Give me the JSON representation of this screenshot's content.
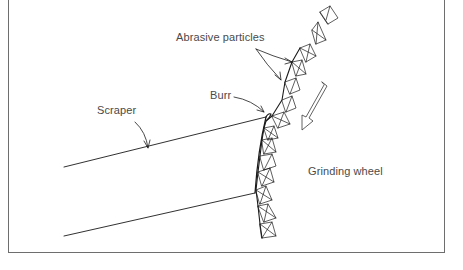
{
  "figure": {
    "labels": {
      "abrasive_particles": "Abrasive particles",
      "burr": "Burr",
      "scraper": "Scraper",
      "grinding_wheel": "Grinding wheel"
    },
    "colors": {
      "line": "#1a1a1a",
      "text": "#4a4a4a",
      "frame": "#6e6e6e",
      "background": "#ffffff"
    },
    "motion_arrow": {
      "direction": "down-left",
      "style": "hollow"
    }
  }
}
